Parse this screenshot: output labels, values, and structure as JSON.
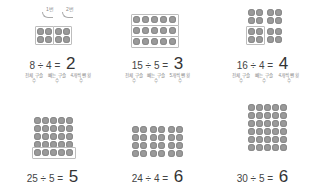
{
  "panels": [
    {
      "id": "p1",
      "equation": {
        "dividend": "8",
        "op": "÷",
        "divisor": "4",
        "eq": "=",
        "answer": "2"
      },
      "labels": [
        "전체 구슬 수",
        "빼는 구슬 수",
        "4개씩 뺀 횟수"
      ],
      "tags": [
        "1번",
        "2번"
      ],
      "layout": {
        "rows": 2,
        "cols": 4,
        "groups": "2 boxes of 2x2"
      }
    },
    {
      "id": "p2",
      "equation": {
        "dividend": "15",
        "op": "÷",
        "divisor": "5",
        "eq": "=",
        "answer": "3"
      },
      "labels": [
        "전체 구슬 수",
        "빼는 구슬 수",
        "5개씩 뺀 횟수"
      ],
      "layout": {
        "rows": 3,
        "cols": 5,
        "groups": "3 boxed rows of 5"
      }
    },
    {
      "id": "p3",
      "equation": {
        "dividend": "16",
        "op": "÷",
        "divisor": "4",
        "eq": "=",
        "answer": "4"
      },
      "labels": [
        "전체 구슬 수",
        "빼는 구슬 수",
        "4개씩 뺀 횟수"
      ],
      "layout": {
        "rows": 4,
        "cols": 4,
        "groups": "4 groups of 2x2, one boxed"
      }
    },
    {
      "id": "p4",
      "equation": {
        "dividend": "25",
        "op": "÷",
        "divisor": "5",
        "eq": "=",
        "answer": "5"
      },
      "layout": {
        "rows": 5,
        "cols": 5,
        "groups": "bottom row boxed"
      }
    },
    {
      "id": "p5",
      "equation": {
        "dividend": "24",
        "op": "÷",
        "divisor": "4",
        "eq": "=",
        "answer": "6"
      },
      "layout": {
        "rows": 4,
        "cols": 6,
        "groups": "3 column pairs"
      }
    },
    {
      "id": "p6",
      "equation": {
        "dividend": "30",
        "op": "÷",
        "divisor": "5",
        "eq": "=",
        "answer": "6"
      },
      "layout": {
        "rows": 6,
        "cols": 5,
        "groups": "rows of 5"
      }
    }
  ],
  "colors": {
    "dot": "#9a9a9a",
    "box": "#bdbdbd",
    "text": "#444444",
    "label": "#8a8a8a"
  }
}
